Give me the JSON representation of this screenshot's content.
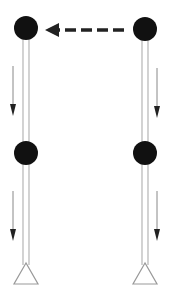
{
  "diagram": {
    "type": "two-column frame with nodes",
    "colors": {
      "node": "#111111",
      "column_line": "#bbbbbb",
      "arrow": "#222222",
      "support": "#999999",
      "background": "#ffffff"
    },
    "columns": [
      {
        "id": "left",
        "x": 26,
        "nodes": [
          {
            "id": "left-top",
            "cx": 26,
            "cy": 28
          },
          {
            "id": "left-middle",
            "cx": 26,
            "cy": 153
          }
        ],
        "support": {
          "apex_y": 263,
          "base_y": 284,
          "half_width": 12
        },
        "downward_arrows": [
          {
            "x": 13,
            "y1": 66,
            "y2": 116
          },
          {
            "x": 13,
            "y1": 191,
            "y2": 241
          }
        ]
      },
      {
        "id": "right",
        "x": 145,
        "nodes": [
          {
            "id": "right-top",
            "cx": 145,
            "cy": 29
          },
          {
            "id": "right-middle",
            "cx": 145,
            "cy": 153
          }
        ],
        "support": {
          "apex_y": 263,
          "base_y": 284,
          "half_width": 12
        },
        "downward_arrows": [
          {
            "x": 157,
            "y1": 68,
            "y2": 118
          },
          {
            "x": 157,
            "y1": 191,
            "y2": 241
          }
        ]
      }
    ],
    "horizontal_arrow": {
      "style": "dashed",
      "direction": "left",
      "from_x": 124,
      "to_x": 45,
      "y": 30
    }
  }
}
